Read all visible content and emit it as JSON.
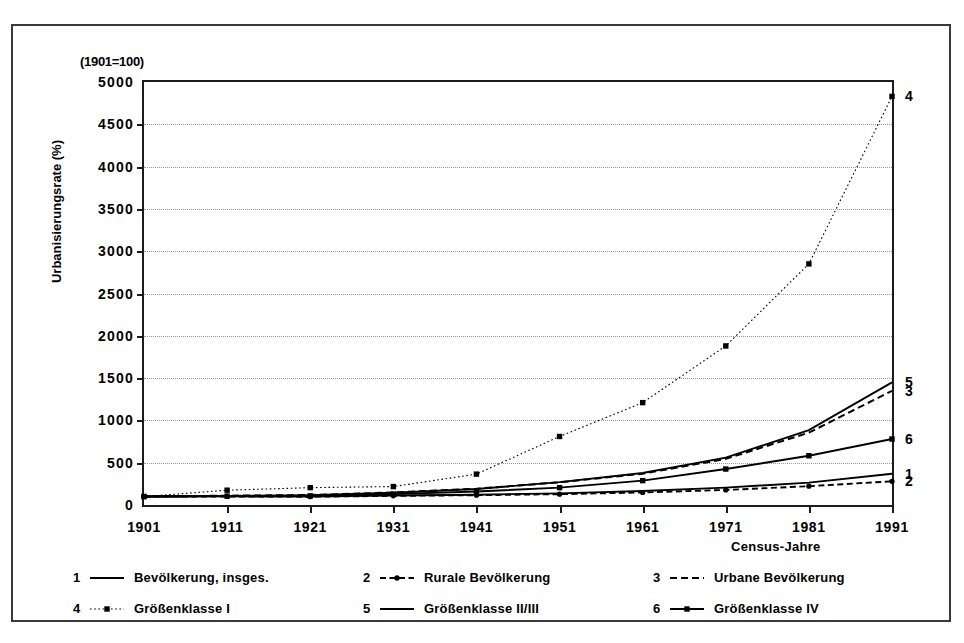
{
  "chart_data": {
    "type": "line",
    "title": "",
    "axis_note": "(1901=100)",
    "xlabel": "Census-Jahre",
    "ylabel": "Urbanisierungsrate (%)",
    "x": [
      1901,
      1911,
      1921,
      1931,
      1941,
      1951,
      1961,
      1971,
      1981,
      1991
    ],
    "xtick_labels": [
      "1901",
      "1911",
      "1921",
      "1931",
      "1941",
      "1951",
      "1961",
      "1971",
      "1981",
      "1991"
    ],
    "ylim": [
      0,
      5000
    ],
    "ytick_labels": [
      "0",
      "500",
      "1000",
      "1500",
      "2000",
      "2500",
      "3000",
      "3500",
      "4000",
      "4500",
      "5000"
    ],
    "ytick_values": [
      0,
      500,
      1000,
      1500,
      2000,
      2500,
      3000,
      3500,
      4000,
      4500,
      5000
    ],
    "grid": true,
    "legend_position": "below-plot",
    "series": [
      {
        "key": "1",
        "name": "Bevölkerung, insges.",
        "style": "solid",
        "marker": "none",
        "end_label": "1",
        "values": [
          100,
          102,
          100,
          112,
          122,
          138,
          165,
          205,
          265,
          370
        ]
      },
      {
        "key": "2",
        "name": "Rurale Bevölkerung",
        "style": "dashed-dot",
        "marker": "dot",
        "end_label": "2",
        "values": [
          100,
          101,
          98,
          108,
          116,
          128,
          148,
          178,
          222,
          280
        ]
      },
      {
        "key": "3",
        "name": "Urbane Bevölkerung",
        "style": "dashed",
        "marker": "none",
        "end_label": "3",
        "values": [
          100,
          110,
          118,
          148,
          192,
          268,
          370,
          545,
          855,
          1350
        ]
      },
      {
        "key": "4",
        "name": "Größenklasse I",
        "style": "dotted",
        "marker": "square",
        "end_label": "4",
        "values": [
          100,
          175,
          205,
          218,
          365,
          810,
          1210,
          1880,
          2850,
          4830
        ]
      },
      {
        "key": "5",
        "name": "Größenklasse II/III",
        "style": "solid",
        "marker": "none",
        "end_label": "5",
        "values": [
          100,
          108,
          116,
          145,
          190,
          270,
          378,
          560,
          885,
          1450
        ]
      },
      {
        "key": "6",
        "name": "Größenklasse IV",
        "style": "solid",
        "marker": "square",
        "end_label": "6",
        "values": [
          100,
          105,
          108,
          128,
          160,
          205,
          288,
          425,
          582,
          780
        ]
      }
    ]
  },
  "legend": {
    "rows": [
      [
        {
          "num": "1",
          "label": "Bevölkerung, insges.",
          "style": "solid",
          "marker": "none"
        },
        {
          "num": "2",
          "label": "Rurale Bevölkerung",
          "style": "dashed-dot",
          "marker": "dot"
        },
        {
          "num": "3",
          "label": "Urbane Bevölkerung",
          "style": "dashed",
          "marker": "none"
        }
      ],
      [
        {
          "num": "4",
          "label": "Größenklasse I",
          "style": "dotted",
          "marker": "square"
        },
        {
          "num": "5",
          "label": "Größenklasse II/III",
          "style": "solid",
          "marker": "none"
        },
        {
          "num": "6",
          "label": "Größenklasse IV",
          "style": "solid",
          "marker": "square"
        }
      ]
    ]
  },
  "colors": {
    "ink": "#000000",
    "frame": "#3a3a3a",
    "axis": "#1c1c1c",
    "grid": "#9a9a9a"
  }
}
